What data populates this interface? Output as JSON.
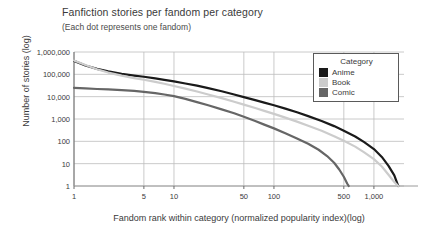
{
  "chart_data": {
    "type": "line",
    "title": "Fanfiction stories per fandom per category",
    "subtitle": "(Each dot represents one fandom)",
    "xlabel": "Fandom rank within category (normalized popularity index)(log)",
    "ylabel": "Number of stories (log)",
    "xscale": "log",
    "yscale": "log",
    "xlim": [
      1,
      2000
    ],
    "ylim": [
      1,
      1000000
    ],
    "grid": true,
    "legend_position": "upper-right",
    "legend_title": "Category",
    "xticks": [
      1,
      5,
      10,
      50,
      100,
      500,
      1000
    ],
    "xtick_labels": [
      "1",
      "5",
      "10",
      "50",
      "100",
      "500",
      "1,000"
    ],
    "yticks": [
      1,
      10,
      100,
      1000,
      10000,
      100000,
      1000000
    ],
    "ytick_labels": [
      "1",
      "10",
      "100",
      "1,000",
      "10,000",
      "100,000",
      "1,000,000"
    ],
    "series": [
      {
        "name": "Anime",
        "color": "#1a1a1a",
        "points": [
          [
            1,
            400000
          ],
          [
            1.3,
            250000
          ],
          [
            1.7,
            175000
          ],
          [
            2.2,
            135000
          ],
          [
            3,
            105000
          ],
          [
            4,
            88000
          ],
          [
            5,
            78000
          ],
          [
            6.5,
            66000
          ],
          [
            8,
            57000
          ],
          [
            10,
            48000
          ],
          [
            13,
            39000
          ],
          [
            17,
            31000
          ],
          [
            22,
            24000
          ],
          [
            30,
            17500
          ],
          [
            40,
            12500
          ],
          [
            50,
            9500
          ],
          [
            65,
            7000
          ],
          [
            80,
            5400
          ],
          [
            100,
            4100
          ],
          [
            130,
            2900
          ],
          [
            170,
            2000
          ],
          [
            220,
            1350
          ],
          [
            300,
            820
          ],
          [
            400,
            480
          ],
          [
            500,
            300
          ],
          [
            650,
            165
          ],
          [
            800,
            92
          ],
          [
            1000,
            45
          ],
          [
            1200,
            20
          ],
          [
            1400,
            8
          ],
          [
            1600,
            3
          ],
          [
            1750,
            1
          ]
        ]
      },
      {
        "name": "Book",
        "color": "#cccccc",
        "points": [
          [
            1,
            420000
          ],
          [
            1.3,
            260000
          ],
          [
            1.7,
            170000
          ],
          [
            2.2,
            120000
          ],
          [
            3,
            88000
          ],
          [
            4,
            68000
          ],
          [
            5,
            57000
          ],
          [
            6.5,
            46000
          ],
          [
            8,
            38000
          ],
          [
            10,
            30000
          ],
          [
            13,
            23000
          ],
          [
            17,
            17000
          ],
          [
            22,
            12500
          ],
          [
            30,
            8600
          ],
          [
            40,
            5900
          ],
          [
            50,
            4400
          ],
          [
            65,
            3100
          ],
          [
            80,
            2300
          ],
          [
            100,
            1700
          ],
          [
            130,
            1150
          ],
          [
            170,
            760
          ],
          [
            220,
            500
          ],
          [
            300,
            295
          ],
          [
            400,
            170
          ],
          [
            500,
            105
          ],
          [
            650,
            58
          ],
          [
            800,
            32
          ],
          [
            1000,
            16
          ],
          [
            1200,
            7.5
          ],
          [
            1400,
            3.2
          ],
          [
            1600,
            1.5
          ],
          [
            1750,
            1
          ]
        ]
      },
      {
        "name": "Comic",
        "color": "#666666",
        "points": [
          [
            1,
            25000
          ],
          [
            1.3,
            23500
          ],
          [
            1.7,
            22000
          ],
          [
            2.2,
            21000
          ],
          [
            3,
            19500
          ],
          [
            4,
            18000
          ],
          [
            5,
            16500
          ],
          [
            6.5,
            14500
          ],
          [
            8,
            12500
          ],
          [
            10,
            10500
          ],
          [
            13,
            8000
          ],
          [
            17,
            5700
          ],
          [
            22,
            4100
          ],
          [
            30,
            2700
          ],
          [
            40,
            1800
          ],
          [
            50,
            1250
          ],
          [
            65,
            820
          ],
          [
            80,
            560
          ],
          [
            100,
            380
          ],
          [
            130,
            230
          ],
          [
            170,
            135
          ],
          [
            220,
            78
          ],
          [
            280,
            42
          ],
          [
            340,
            22
          ],
          [
            400,
            11
          ],
          [
            450,
            5.5
          ],
          [
            500,
            2.6
          ],
          [
            540,
            1.3
          ],
          [
            560,
            1
          ]
        ]
      }
    ]
  }
}
